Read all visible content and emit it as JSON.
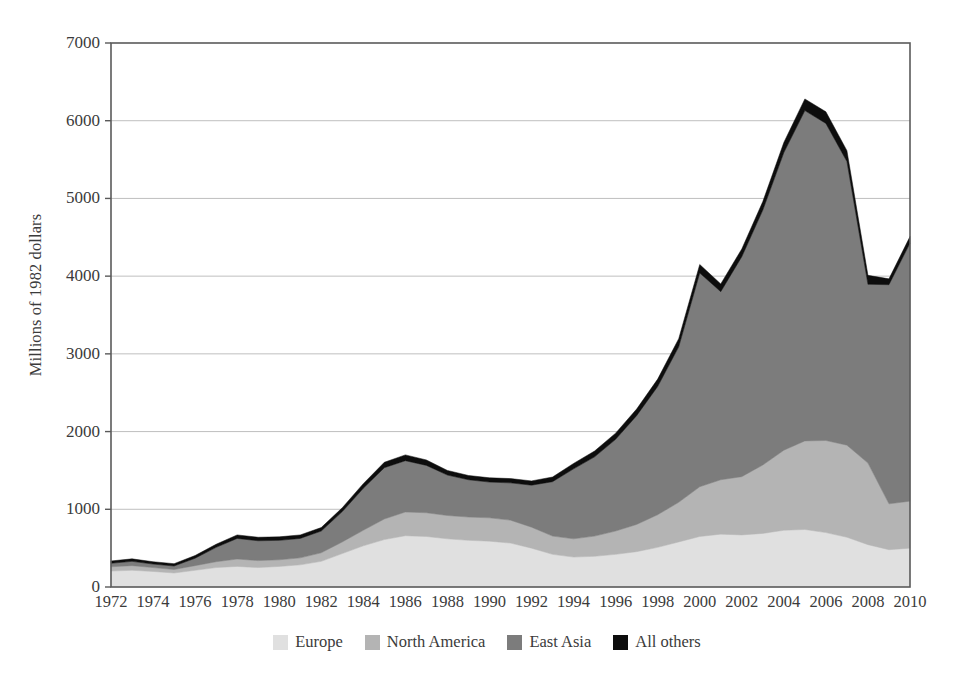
{
  "chart_data": {
    "type": "area",
    "stacked": true,
    "title": "",
    "subtitle": "",
    "xlabel": "",
    "ylabel": "Millions of 1982 dollars",
    "xlim": [
      1972,
      2010
    ],
    "ylim": [
      0,
      7000
    ],
    "yticks": [
      0,
      1000,
      2000,
      3000,
      4000,
      5000,
      6000,
      7000
    ],
    "ytick_labels": [
      "0",
      "1000",
      "2000",
      "3000",
      "4000",
      "5000",
      "6000",
      "7000"
    ],
    "xticks": [
      1972,
      1974,
      1976,
      1978,
      1980,
      1982,
      1984,
      1986,
      1988,
      1990,
      1992,
      1994,
      1996,
      1998,
      2000,
      2002,
      2004,
      2006,
      2008,
      2010
    ],
    "xtick_labels": [
      "1972",
      "1974",
      "1976",
      "1978",
      "1980",
      "1982",
      "1984",
      "1986",
      "1988",
      "1990",
      "1992",
      "1994",
      "1996",
      "1998",
      "2000",
      "2002",
      "2004",
      "2006",
      "2008",
      "2010"
    ],
    "grid": "horizontal",
    "legend_position": "bottom",
    "x": [
      1972,
      1973,
      1974,
      1975,
      1976,
      1977,
      1978,
      1979,
      1980,
      1981,
      1982,
      1983,
      1984,
      1985,
      1986,
      1987,
      1988,
      1989,
      1990,
      1991,
      1992,
      1993,
      1994,
      1995,
      1996,
      1997,
      1998,
      1999,
      2000,
      2001,
      2002,
      2003,
      2004,
      2005,
      2006,
      2007,
      2008,
      2009,
      2010
    ],
    "series": [
      {
        "name": "Europe",
        "color": "#e0e0e0",
        "values": [
          205,
          215,
          200,
          180,
          215,
          250,
          265,
          250,
          265,
          285,
          330,
          430,
          530,
          610,
          660,
          650,
          620,
          600,
          590,
          565,
          500,
          420,
          385,
          395,
          420,
          455,
          510,
          580,
          650,
          680,
          670,
          690,
          730,
          740,
          700,
          640,
          545,
          480,
          500
        ]
      },
      {
        "name": "North America",
        "color": "#b4b4b4",
        "values": [
          55,
          60,
          50,
          45,
          60,
          75,
          95,
          90,
          85,
          90,
          110,
          150,
          200,
          265,
          305,
          305,
          300,
          300,
          300,
          295,
          270,
          235,
          235,
          260,
          300,
          350,
          420,
          510,
          640,
          700,
          750,
          880,
          1030,
          1140,
          1185,
          1185,
          1050,
          590,
          605
        ]
      },
      {
        "name": "East Asia",
        "color": "#7c7c7c",
        "values": [
          45,
          55,
          45,
          45,
          95,
          185,
          265,
          255,
          250,
          250,
          280,
          390,
          540,
          660,
          660,
          610,
          520,
          480,
          460,
          480,
          540,
          700,
          900,
          1020,
          1180,
          1400,
          1650,
          2000,
          2750,
          2420,
          2830,
          3280,
          3830,
          4250,
          4080,
          3650,
          2300,
          2820,
          3320
        ]
      },
      {
        "name": "All others",
        "color": "#0d0d0d",
        "values": [
          30,
          32,
          30,
          30,
          35,
          40,
          45,
          45,
          45,
          45,
          45,
          50,
          60,
          70,
          75,
          70,
          60,
          55,
          55,
          55,
          55,
          60,
          70,
          75,
          80,
          85,
          95,
          105,
          110,
          100,
          100,
          110,
          130,
          150,
          150,
          140,
          115,
          75,
          85
        ]
      }
    ]
  },
  "axis": {
    "y_title": "Millions of 1982 dollars"
  },
  "legend": {
    "items": [
      {
        "label": "Europe",
        "color": "#e0e0e0"
      },
      {
        "label": "North America",
        "color": "#b4b4b4"
      },
      {
        "label": "East Asia",
        "color": "#7c7c7c"
      },
      {
        "label": "All others",
        "color": "#0d0d0d"
      }
    ]
  },
  "plot_geometry": {
    "left": 111,
    "right": 910,
    "top": 43,
    "bottom": 587
  }
}
